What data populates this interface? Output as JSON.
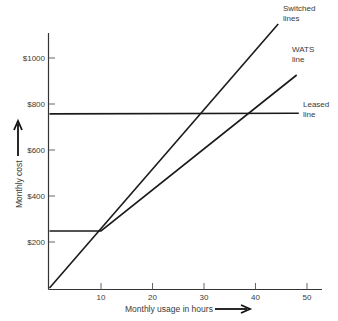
{
  "chart_data": {
    "type": "line",
    "title": "",
    "xlabel": "Monthly usage in hours",
    "ylabel": "Monthly cost",
    "xlim": [
      0,
      53
    ],
    "ylim": [
      0,
      1120
    ],
    "grid": false,
    "legend": "none (lines labeled directly at right ends)",
    "x_ticks": [
      10,
      20,
      30,
      40,
      50
    ],
    "x_tick_labels": [
      "10",
      "20",
      "30",
      "40",
      "50"
    ],
    "y_ticks": [
      200,
      400,
      600,
      800,
      1000
    ],
    "y_tick_labels": [
      "$200",
      "$400",
      "$600",
      "$800",
      "$1000"
    ],
    "series": [
      {
        "name": "Switched lines",
        "label_lines": [
          "Switched",
          "lines"
        ],
        "points": [
          [
            0,
            0
          ],
          [
            44.4,
            1148
          ]
        ]
      },
      {
        "name": "WATS line",
        "label_lines": [
          "WATS",
          "line"
        ],
        "points": [
          [
            0,
            248
          ],
          [
            10,
            248
          ],
          [
            48,
            926
          ]
        ]
      },
      {
        "name": "Leased line",
        "label_lines": [
          "Leased",
          "line"
        ],
        "points": [
          [
            0,
            757
          ],
          [
            48.4,
            760
          ]
        ]
      }
    ],
    "annotations": [
      {
        "text": "→ arrow after x-axis label",
        "type": "arrow"
      },
      {
        "text": "↑ arrow above y-axis label",
        "type": "arrow"
      }
    ]
  }
}
